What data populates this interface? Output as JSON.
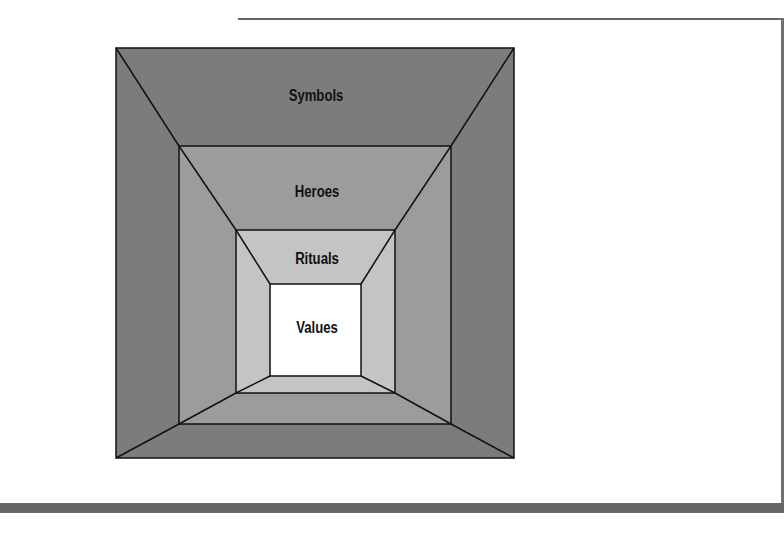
{
  "diagram": {
    "layers": [
      {
        "label": "Symbols",
        "fill": "#7c7c7c",
        "rect": {
          "x1": 116,
          "y1": 48,
          "x2": 514,
          "y2": 458
        },
        "label_pos": {
          "x": 316,
          "y": 87
        }
      },
      {
        "label": "Heroes",
        "fill": "#9c9c9c",
        "rect": {
          "x1": 179,
          "y1": 146,
          "x2": 451,
          "y2": 424
        },
        "label_pos": {
          "x": 317,
          "y": 183
        }
      },
      {
        "label": "Rituals",
        "fill": "#c4c4c4",
        "rect": {
          "x1": 236,
          "y1": 230,
          "x2": 395,
          "y2": 393
        },
        "label_pos": {
          "x": 317,
          "y": 250
        }
      },
      {
        "label": "Values",
        "fill": "#ffffff",
        "rect": {
          "x1": 270,
          "y1": 284,
          "x2": 361,
          "y2": 376
        },
        "label_pos": {
          "x": 317,
          "y": 319
        }
      }
    ],
    "colors": {
      "stroke": "#111111",
      "frame": "#666666",
      "background": "#ffffff"
    }
  }
}
